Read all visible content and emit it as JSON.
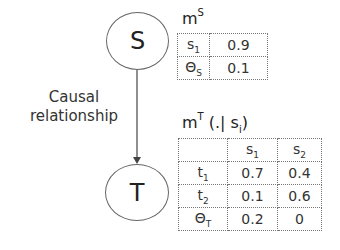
{
  "nodes": {
    "source": {
      "label": "S"
    },
    "target": {
      "label": "T"
    }
  },
  "edge": {
    "label_line1": "Causal",
    "label_line2": "relationship"
  },
  "table_s": {
    "title_base": "m",
    "title_sup": "S",
    "rows": [
      {
        "label_base": "s",
        "label_sub": "1",
        "value": "0.9"
      },
      {
        "label_base": "Θ",
        "label_sub": "S",
        "value": "0.1"
      }
    ]
  },
  "table_t": {
    "title_base": "m",
    "title_sup": "T",
    "title_rest": " (.| s",
    "title_sub": "i",
    "title_end": ")",
    "header": [
      {
        "base": "",
        "sub": ""
      },
      {
        "base": "s",
        "sub": "1"
      },
      {
        "base": "s",
        "sub": "2"
      }
    ],
    "rows": [
      {
        "label_base": "t",
        "label_sub": "1",
        "values": [
          "0.7",
          "0.4"
        ]
      },
      {
        "label_base": "t",
        "label_sub": "2",
        "values": [
          "0.1",
          "0.6"
        ]
      },
      {
        "label_base": "Θ",
        "label_sub": "T",
        "values": [
          "0.2",
          "0"
        ]
      }
    ]
  }
}
